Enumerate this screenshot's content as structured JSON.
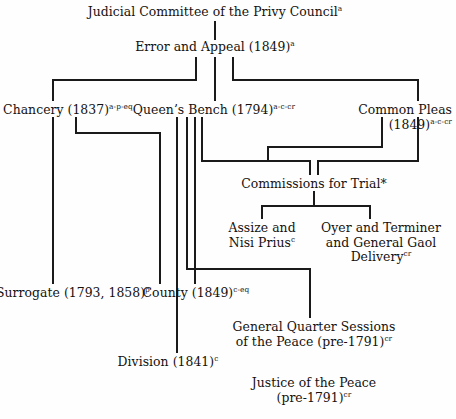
{
  "diagram": {
    "width": 456,
    "height": 419,
    "line_color": "#1a1a1a",
    "text_color": "#14110f",
    "background": "#ffffff",
    "caption": "",
    "nodes": [
      {
        "id": "judicial-committee",
        "name": "judicial-committee-of-the-privy-council",
        "align": "ctr",
        "x": 215,
        "y": 5,
        "lines": [
          {
            "text": "Judicial Committee of the Privy Council",
            "sup": "a"
          }
        ]
      },
      {
        "id": "error-and-appeal",
        "name": "error-and-appeal",
        "align": "ctr",
        "x": 215,
        "y": 40,
        "lines": [
          {
            "text": "Error and Appeal (1849)",
            "sup": "a"
          }
        ]
      },
      {
        "id": "chancery",
        "name": "chancery",
        "align": "ctr",
        "x": 68,
        "y": 103,
        "lines": [
          {
            "text": "Chancery (1837)",
            "sup": "a-p-eq"
          }
        ]
      },
      {
        "id": "queens-bench",
        "name": "queens-bench",
        "align": "ctr",
        "x": 214,
        "y": 103,
        "lines": [
          {
            "text": "Queen’s Bench (1794)",
            "sup": "a-c-cr"
          }
        ]
      },
      {
        "id": "common-pleas",
        "name": "common-pleas",
        "align": "rgt",
        "x": 452,
        "y": 103,
        "lines": [
          {
            "text": "Common Pleas",
            "sup": ""
          },
          {
            "text": "(1849)",
            "sup": "a-c-cr"
          }
        ]
      },
      {
        "id": "commissions-for-trial",
        "name": "commissions-for-trial",
        "align": "ctr",
        "x": 314,
        "y": 177,
        "lines": [
          {
            "text": "Commissions for Trial*",
            "sup": ""
          }
        ]
      },
      {
        "id": "assize-nisi-prius",
        "name": "assize-and-nisi-prius",
        "align": "ctr",
        "x": 262,
        "y": 221,
        "lines": [
          {
            "text": "Assize and",
            "sup": ""
          },
          {
            "text": "Nisi Prius",
            "sup": "c"
          }
        ]
      },
      {
        "id": "oyer-terminer",
        "name": "oyer-and-terminer-and-general-gaol-delivery",
        "align": "ctr",
        "x": 381,
        "y": 221,
        "lines": [
          {
            "text": "Oyer and Terminer",
            "sup": ""
          },
          {
            "text": "and General Gaol",
            "sup": ""
          },
          {
            "text": "Delivery",
            "sup": "cr"
          }
        ]
      },
      {
        "id": "surrogate",
        "name": "surrogate",
        "align": "ctr",
        "x": 73,
        "y": 286,
        "lines": [
          {
            "text": "Surrogate (1793, 1858)",
            "sup": "p"
          }
        ]
      },
      {
        "id": "county",
        "name": "county",
        "align": "ctr",
        "x": 196,
        "y": 286,
        "lines": [
          {
            "text": "County (1849)",
            "sup": "c-eq"
          }
        ]
      },
      {
        "id": "general-quarter-sessions",
        "name": "general-quarter-sessions-of-the-peace",
        "align": "ctr",
        "x": 314,
        "y": 320,
        "lines": [
          {
            "text": "General Quarter Sessions",
            "sup": ""
          },
          {
            "text": "of the Peace (pre-1791)",
            "sup": "cr"
          }
        ]
      },
      {
        "id": "division",
        "name": "division",
        "align": "ctr",
        "x": 168,
        "y": 355,
        "lines": [
          {
            "text": "Division (1841)",
            "sup": "c"
          }
        ]
      },
      {
        "id": "justice-of-the-peace",
        "name": "justice-of-the-peace",
        "align": "ctr",
        "x": 314,
        "y": 376,
        "lines": [
          {
            "text": "Justice of the Peace",
            "sup": ""
          },
          {
            "text": "(pre-1791)",
            "sup": "cr"
          }
        ]
      }
    ],
    "connectors": [
      {
        "name": "wire-privy-council-to-error-appeal",
        "points": [
          [
            215,
            22
          ],
          [
            215,
            39
          ]
        ]
      },
      {
        "name": "wire-error-appeal-to-chancery-bus",
        "points": [
          [
            196,
            58
          ],
          [
            196,
            80
          ],
          [
            53,
            80
          ],
          [
            53,
            100
          ]
        ]
      },
      {
        "name": "wire-error-appeal-to-queens-bench",
        "points": [
          [
            215,
            58
          ],
          [
            215,
            100
          ]
        ]
      },
      {
        "name": "wire-error-appeal-to-common-pleas-bus",
        "points": [
          [
            233,
            58
          ],
          [
            233,
            80
          ],
          [
            418,
            80
          ],
          [
            418,
            100
          ]
        ]
      },
      {
        "name": "wire-chancery-to-surrogate",
        "points": [
          [
            53,
            118
          ],
          [
            53,
            283
          ]
        ]
      },
      {
        "name": "wire-chancery-to-county",
        "points": [
          [
            76,
            118
          ],
          [
            76,
            133
          ],
          [
            160,
            133
          ],
          [
            160,
            283
          ]
        ]
      },
      {
        "name": "wire-queens-bench-to-division",
        "points": [
          [
            177,
            118
          ],
          [
            177,
            352
          ]
        ]
      },
      {
        "name": "wire-queens-bench-to-county",
        "points": [
          [
            195,
            118
          ],
          [
            195,
            283
          ]
        ]
      },
      {
        "name": "wire-queens-bench-to-commissions-bus",
        "points": [
          [
            202,
            118
          ],
          [
            202,
            161
          ],
          [
            310,
            161
          ],
          [
            310,
            174
          ]
        ]
      },
      {
        "name": "wire-queens-bench-to-general-quarter-sessions",
        "points": [
          [
            187,
            118
          ],
          [
            187,
            269
          ],
          [
            310,
            269
          ],
          [
            310,
            317
          ]
        ]
      },
      {
        "name": "wire-common-pleas-to-commissions-left",
        "points": [
          [
            382,
            118
          ],
          [
            382,
            147
          ],
          [
            268,
            147
          ],
          [
            268,
            161
          ]
        ]
      },
      {
        "name": "wire-common-pleas-to-commissions-right",
        "points": [
          [
            418,
            118
          ],
          [
            418,
            161
          ],
          [
            318,
            161
          ],
          [
            318,
            174
          ]
        ]
      },
      {
        "name": "wire-commissions-to-children-bus",
        "points": [
          [
            314,
            192
          ],
          [
            314,
            206
          ]
        ]
      },
      {
        "name": "wire-commissions-to-assize",
        "points": [
          [
            262,
            206
          ],
          [
            262,
            218
          ]
        ]
      },
      {
        "name": "wire-commissions-to-oyer-terminer",
        "points": [
          [
            370,
            206
          ],
          [
            370,
            218
          ]
        ]
      },
      {
        "name": "wire-commissions-children-crossbar",
        "points": [
          [
            262,
            206
          ],
          [
            370,
            206
          ]
        ]
      },
      {
        "name": "wire-county-to-division",
        "points": [
          [
            177,
            301
          ],
          [
            177,
            352
          ]
        ]
      },
      {
        "name": "wire-general-quarter-sessions-to-justice-of-the-peace",
        "points": [
          [
            314,
            317
          ],
          [
            314,
            317
          ]
        ]
      }
    ]
  }
}
